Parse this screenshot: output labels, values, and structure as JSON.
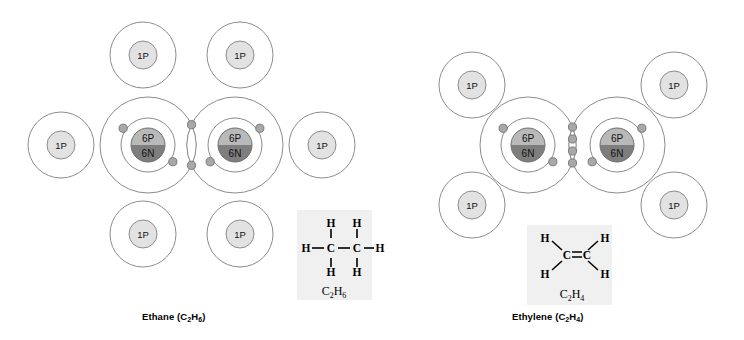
{
  "figure": {
    "background_color": "#ffffff",
    "width": 744,
    "height": 340
  },
  "palette": {
    "shell_stroke": "#8c8c8c",
    "electron_fill": "#a8a8a8",
    "electron_stroke": "#707070",
    "hydrogen_nucleus_fill": "#e2e2e2",
    "hydrogen_nucleus_stroke": "#8c8c8c",
    "carbon_proton_fill": "#b9b9b9",
    "carbon_neutron_fill": "#7e7e7e",
    "carbon_nucleus_stroke": "#6e6e6e",
    "formula_box_fill": "#f0f0f0",
    "bond_line": "#000000",
    "text_color": "#000000"
  },
  "molecules": [
    {
      "id": "ethane",
      "name": "Ethane",
      "formula": "C2H6",
      "caption_name": "Ethane (C",
      "caption_sub1": "2",
      "caption_mid": "H",
      "caption_sub2": "6",
      "caption_end": ")",
      "bond_type": "single",
      "carbon_count": 2,
      "hydrogen_count": 6,
      "carbons": [
        {
          "label_protons": "6P",
          "label_neutrons": "6N",
          "cx": 148,
          "cy": 145
        },
        {
          "label_protons": "6P",
          "label_neutrons": "6N",
          "cx": 235,
          "cy": 145
        }
      ],
      "hydrogens": [
        {
          "label": "1P",
          "cx": 143,
          "cy": 55,
          "position": "top-left"
        },
        {
          "label": "1P",
          "cx": 240,
          "cy": 55,
          "position": "top-right"
        },
        {
          "label": "1P",
          "cx": 61,
          "cy": 145,
          "position": "left"
        },
        {
          "label": "1P",
          "cx": 322,
          "cy": 145,
          "position": "right"
        },
        {
          "label": "1P",
          "cx": 143,
          "cy": 234,
          "position": "bottom-left"
        },
        {
          "label": "1P",
          "cx": 240,
          "cy": 234,
          "position": "bottom-right"
        }
      ],
      "shared_pairs": 7,
      "skeletal_formula": {
        "carbon_labels": [
          "C",
          "C"
        ],
        "hydrogen_labels": [
          "H",
          "H",
          "H",
          "H",
          "H",
          "H"
        ],
        "formula_main": "C",
        "formula_sub_1": "2",
        "formula_mid": "H",
        "formula_sub_2": "6",
        "box": {
          "x": 297,
          "y": 210,
          "w": 75,
          "h": 90
        }
      }
    },
    {
      "id": "ethylene",
      "name": "Ethylene",
      "formula": "C2H4",
      "caption_name": "Ethylene (C",
      "caption_sub1": "2",
      "caption_mid": "H",
      "caption_sub2": "4",
      "caption_end": ")",
      "bond_type": "double",
      "carbon_count": 2,
      "hydrogen_count": 4,
      "carbons": [
        {
          "label_protons": "6P",
          "label_neutrons": "6N",
          "cx": 528,
          "cy": 145
        },
        {
          "label_protons": "6P",
          "label_neutrons": "6N",
          "cx": 617,
          "cy": 145
        }
      ],
      "hydrogens": [
        {
          "label": "1P",
          "cx": 472,
          "cy": 85,
          "position": "upper-left"
        },
        {
          "label": "1P",
          "cx": 674,
          "cy": 85,
          "position": "upper-right"
        },
        {
          "label": "1P",
          "cx": 472,
          "cy": 205,
          "position": "lower-left"
        },
        {
          "label": "1P",
          "cx": 674,
          "cy": 205,
          "position": "lower-right"
        }
      ],
      "shared_pairs": 6,
      "skeletal_formula": {
        "carbon_labels": [
          "C",
          "C"
        ],
        "hydrogen_labels": [
          "H",
          "H",
          "H",
          "H"
        ],
        "formula_main": "C",
        "formula_sub_1": "2",
        "formula_mid": "H",
        "formula_sub_2": "4",
        "box": {
          "x": 527,
          "y": 225,
          "w": 85,
          "h": 80
        }
      }
    }
  ],
  "chart_data": {
    "type": "diagram",
    "subjects": [
      "Ethane (C2H6)",
      "Ethylene (C2H4)"
    ]
  }
}
